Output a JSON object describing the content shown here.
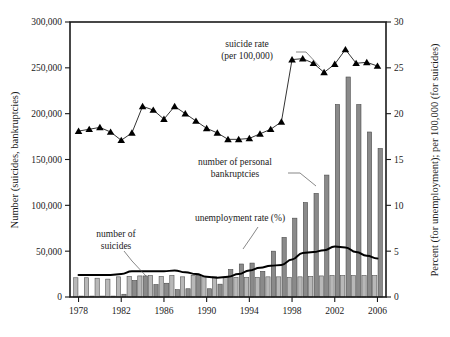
{
  "chart_data": {
    "type": "bar",
    "title": "",
    "subtitle": "",
    "xlabel": "",
    "ylabel": "Number (suicides, bankruptcies)",
    "y2label": "Percent (for unemployment); per 100,000 (for suicides)",
    "grid": false,
    "legend_position": "inline-annotations",
    "x": [
      1978,
      1979,
      1980,
      1981,
      1982,
      1983,
      1984,
      1985,
      1986,
      1987,
      1988,
      1989,
      1990,
      1991,
      1992,
      1993,
      1994,
      1995,
      1996,
      1997,
      1998,
      1999,
      2000,
      2001,
      2002,
      2003,
      2004,
      2005,
      2006
    ],
    "xtick_labels": [
      "1978",
      "1982",
      "1986",
      "1990",
      "1994",
      "1998",
      "2002",
      "2006"
    ],
    "xtick_values": [
      1978,
      1982,
      1986,
      1990,
      1994,
      1998,
      2002,
      2006
    ],
    "xlim": [
      1977.2,
      2006.8
    ],
    "ylim": [
      0,
      300000
    ],
    "ytick_labels": [
      "0",
      "50,000",
      "100,000",
      "150,000",
      "200,000",
      "250,000",
      "300,000"
    ],
    "ytick_values": [
      0,
      50000,
      100000,
      150000,
      200000,
      250000,
      300000
    ],
    "y2lim": [
      0,
      30
    ],
    "y2tick_labels": [
      "0",
      "5",
      "10",
      "15",
      "20",
      "25",
      "30"
    ],
    "y2tick_values": [
      0,
      5,
      10,
      15,
      20,
      25,
      30
    ],
    "series": [
      {
        "name": "number of suicides",
        "type": "bar",
        "axis": "left",
        "color": "#b8b8b8",
        "edge_color": "#555555",
        "values": [
          21000,
          21000,
          20500,
          19500,
          22000,
          22500,
          23000,
          23500,
          22500,
          23500,
          22000,
          23500,
          22000,
          22000,
          21500,
          21500,
          21500,
          21500,
          22000,
          22000,
          21500,
          22000,
          22500,
          23000,
          23500,
          23500,
          23500,
          23500,
          23500
        ]
      },
      {
        "name": "number of personal bankruptcies",
        "type": "bar",
        "axis": "left",
        "color": "#8a8a8a",
        "edge_color": "#4a4a4a",
        "values": [
          1000,
          1000,
          1000,
          1000,
          3000,
          18000,
          23000,
          13500,
          15000,
          8000,
          9000,
          24000,
          9000,
          14000,
          30000,
          36000,
          37000,
          28000,
          50000,
          65000,
          86000,
          103000,
          113000,
          133000,
          210000,
          240000,
          210000,
          180000,
          162000
        ]
      },
      {
        "name": "suicide rate (per 100,000)",
        "type": "line",
        "marker": "triangle",
        "axis": "right",
        "color": "#000000",
        "values": [
          18.1,
          18.3,
          18.5,
          18.0,
          17.1,
          17.9,
          20.8,
          20.4,
          19.4,
          20.8,
          20.0,
          19.2,
          18.4,
          17.9,
          17.2,
          17.2,
          17.3,
          17.8,
          18.3,
          19.1,
          25.9,
          26.0,
          25.5,
          24.5,
          25.4,
          27.0,
          25.5,
          25.6,
          25.2
        ]
      },
      {
        "name": "unemployment rate (%)",
        "type": "line",
        "axis": "right",
        "color": "#000000",
        "values": [
          2.4,
          2.4,
          2.4,
          2.4,
          2.5,
          2.8,
          2.8,
          2.8,
          2.8,
          2.9,
          2.7,
          2.5,
          2.2,
          2.1,
          2.2,
          2.5,
          2.9,
          3.2,
          3.4,
          3.5,
          4.1,
          4.8,
          4.9,
          5.1,
          5.5,
          5.4,
          4.9,
          4.5,
          4.2
        ]
      }
    ],
    "annotations": [
      {
        "id": "suicide-rate-annotation",
        "text_lines": [
          "suicide rate",
          "(per 100,000)"
        ],
        "x": 247,
        "y": 47
      },
      {
        "id": "bankruptcies-annotation",
        "text_lines": [
          "number of personal",
          "bankruptcies"
        ],
        "x": 235,
        "y": 165
      },
      {
        "id": "unemployment-annotation",
        "text_lines": [
          "unemployment rate (%)"
        ],
        "x": 240,
        "y": 221
      },
      {
        "id": "suicides-annotation",
        "text_lines": [
          "number of",
          "suicides"
        ],
        "x": 116,
        "y": 237
      }
    ]
  }
}
